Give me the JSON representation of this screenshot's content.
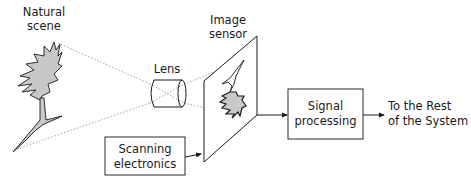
{
  "diagram": {
    "nodes": {
      "scene": {
        "label_line1": "Natural",
        "label_line2": "scene"
      },
      "lens": {
        "label": "Lens"
      },
      "sensor": {
        "label_line1": "Image",
        "label_line2": "sensor"
      },
      "scanning": {
        "label_line1": "Scanning",
        "label_line2": "electronics"
      },
      "signal": {
        "label_line1": "Signal",
        "label_line2": "processing"
      },
      "output": {
        "label_line1": "To the Rest",
        "label_line2": "of the System"
      }
    },
    "edges": [
      {
        "from": "scene",
        "to": "lens",
        "style": "dotted"
      },
      {
        "from": "lens",
        "to": "sensor",
        "style": "dotted"
      },
      {
        "from": "scanning",
        "to": "sensor",
        "style": "arrow"
      },
      {
        "from": "sensor",
        "to": "signal",
        "style": "arrow"
      },
      {
        "from": "signal",
        "to": "output",
        "style": "arrow"
      }
    ],
    "colors": {
      "stroke": "#1a1a1a",
      "fill_gray": "#c8c8c8",
      "ray": "#8a8a8a",
      "background": "#ffffff"
    }
  }
}
